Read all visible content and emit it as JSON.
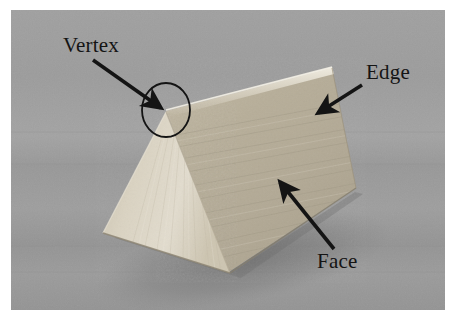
{
  "figure": {
    "kind": "photograph",
    "plate_background_color": "#9a9a9a",
    "page_background_color": "#ffffff",
    "annotation_color": "#141414",
    "object_color": "#cfc6b2"
  },
  "annotations": [
    {
      "id": "vertex",
      "label": "Vertex",
      "label_x": 63,
      "label_y": 48,
      "arrow_from_x": 93,
      "arrow_from_y": 60,
      "arrow_to_x": 161,
      "arrow_to_y": 108,
      "marker": "ellipse",
      "marker_cx": 166,
      "marker_cy": 110,
      "marker_rx": 24,
      "marker_ry": 27
    },
    {
      "id": "edge",
      "label": "Edge",
      "label_x": 366,
      "label_y": 79,
      "arrow_from_x": 362,
      "arrow_from_y": 85,
      "arrow_to_x": 318,
      "arrow_to_y": 113,
      "marker": "none"
    },
    {
      "id": "face",
      "label": "Face",
      "label_x": 317,
      "label_y": 268,
      "arrow_from_x": 334,
      "arrow_from_y": 249,
      "arrow_to_x": 280,
      "arrow_to_y": 182,
      "marker": "none"
    }
  ],
  "geometry": {
    "front_triangle": [
      [
        166,
        112
      ],
      [
        103,
        233
      ],
      [
        229,
        273
      ]
    ],
    "top_ridge": [
      [
        166,
        112
      ],
      [
        332,
        69
      ]
    ],
    "back_right_corner": [
      [
        356,
        189
      ]
    ],
    "right_face": [
      [
        166,
        112
      ],
      [
        332,
        69
      ],
      [
        356,
        189
      ],
      [
        229,
        273
      ]
    ],
    "shadow_tint": "#7f7f7f"
  }
}
